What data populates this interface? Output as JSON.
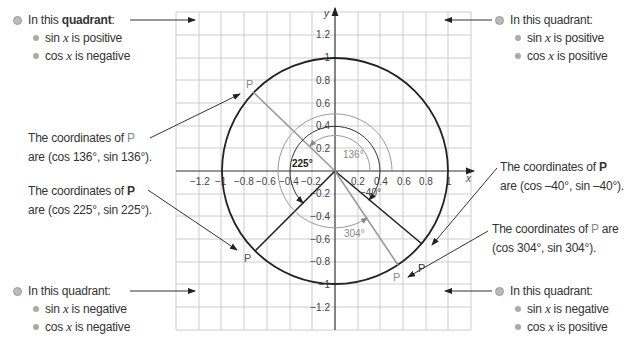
{
  "quadrants": {
    "top_left": {
      "head_pre": "In this ",
      "head_bold": "quadrant",
      "head_post": ":",
      "sin": "is positive",
      "cos": "is negative"
    },
    "top_right": {
      "head": "In this quadrant:",
      "sin": "is positive",
      "cos": "is positive"
    },
    "bottom_left": {
      "head": "In this quadrant:",
      "sin": "is negative",
      "cos": "is negative"
    },
    "bottom_right": {
      "head": "In this quadrant:",
      "sin": "is negative",
      "cos": "is positive"
    }
  },
  "labels": {
    "sin": "sin ",
    "cos": "cos ",
    "x": "x",
    "coords_prefix": "The coordinates of ",
    "P": "P",
    "are": "are",
    "c136": "are (cos 136°, sin 136°).",
    "c225": "are (cos 225°, sin 225°).",
    "c40": "are (cos –40°, sin –40°).",
    "c304": "(cos 304°, sin 304°)."
  },
  "axes": {
    "x_label": "x",
    "y_label": "y",
    "x_ticks": [
      "−1.2",
      "−1",
      "−0.8",
      "−0.6",
      "−0.4",
      "−0.2",
      "0.2",
      "0.4",
      "0.6",
      "0.8",
      "1"
    ],
    "y_ticks": [
      "1.2",
      "1",
      "0.8",
      "0.6",
      "0.4",
      "0.2",
      "−0.2",
      "−0.4",
      "−0.6",
      "−0.8",
      "−1",
      "−1.2"
    ]
  },
  "angles": {
    "a136": "136°",
    "a225": "225°",
    "a40": "−40°",
    "a304": "304°"
  },
  "colors": {
    "text": "#333333",
    "gray": "#888888",
    "grid": "#cccccc",
    "circle": "#222222"
  }
}
